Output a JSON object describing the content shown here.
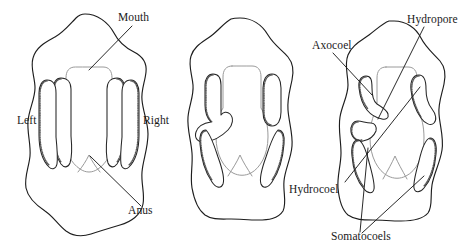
{
  "figure": {
    "background_color": "#ffffff",
    "ink_color": "#1d1d1d",
    "gut_color": "#9a9a9a",
    "panels": [
      {
        "id": "panel-left",
        "name": "stage-one",
        "labels": [
          {
            "key": "mouth",
            "text": "Mouth"
          },
          {
            "key": "left",
            "text": "Left"
          },
          {
            "key": "right",
            "text": "Right"
          },
          {
            "key": "anus",
            "text": "Anus"
          }
        ]
      },
      {
        "id": "panel-middle",
        "name": "stage-two",
        "labels": []
      },
      {
        "id": "panel-right",
        "name": "stage-three",
        "labels": [
          {
            "key": "axocoel",
            "text": "Axocoel"
          },
          {
            "key": "hydropore",
            "text": "Hydropore"
          },
          {
            "key": "hydrocoel",
            "text": "Hydrocoel"
          },
          {
            "key": "somatocoels",
            "text": "Somatocoels"
          }
        ]
      }
    ]
  },
  "labels": {
    "mouth": "Mouth",
    "left": "Left",
    "right": "Right",
    "anus": "Anus",
    "axocoel": "Axocoel",
    "hydropore": "Hydropore",
    "hydrocoel": "Hydrocoel",
    "somatocoels": "Somatocoels"
  }
}
